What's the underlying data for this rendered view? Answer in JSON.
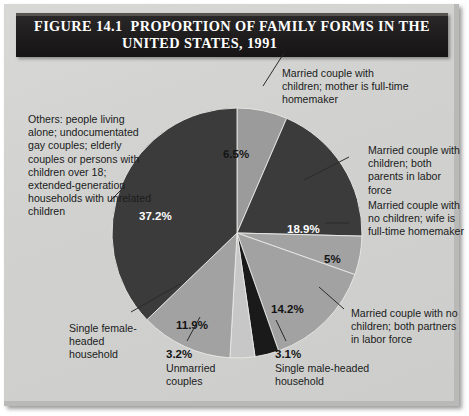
{
  "figure": {
    "number": "FIGURE 14.1",
    "title_line1": "PROPORTION OF FAMILY FORMS IN THE",
    "title_line2": "UNITED STATES, 1991"
  },
  "colors": {
    "background": "#d3d4d2",
    "title_bar": "#211f20",
    "title_text": "#ffffff",
    "label_text": "#1b1b1b",
    "slice_light_gray": "#9b9b9b",
    "slice_dark": "#3b3b3b",
    "slice_mid_gray": "#a2a2a2",
    "slice_pale_gray": "#c7c7c7",
    "slice_black": "#1a1a1a"
  },
  "labels": {
    "others": "Others: people living alone; undocumentated gay couples; elderly couples or persons with children over 18; extended-generation households with unrelated children",
    "married_children_homemaker": "Married couple with children; mother is full-time homemaker",
    "married_children_both_labor": "Married couple with children; both parents in labor force",
    "married_nochildren_wife_homemaker": "Married couple with no children; wife is full-time homemaker",
    "married_nochildren_both_labor": "Married couple with no children; both partners in labor force",
    "single_female_household": "Single female-headed household",
    "unmarried_couples": "Unmarried couples",
    "single_male_household": "Single male-headed household"
  },
  "chart_data": {
    "type": "pie",
    "unit": "percent",
    "legend": "callout labels with leader lines",
    "start_angle_deg": 0,
    "direction": "clockwise",
    "categories": [
      "Married couple with children; mother is full-time homemaker",
      "Married couple with children; both parents in labor force",
      "Married couple with no children; wife is full-time homemaker",
      "Married couple with no children; both partners in labor force",
      "Single male-headed household",
      "Unmarried couples",
      "Single female-headed household",
      "Others: people living alone; undocumentated gay couples; elderly couples or persons with children over 18; extended-generation households with unrelated children"
    ],
    "values": [
      6.5,
      18.9,
      5,
      14.2,
      3.1,
      3.2,
      11.9,
      37.2
    ],
    "value_labels": [
      "6.5%",
      "18.9%",
      "5%",
      "14.2%",
      "3.1%",
      "3.2%",
      "11.9%",
      "37.2%"
    ],
    "colors": [
      "#9b9b9b",
      "#3b3b3b",
      "#a2a2a2",
      "#a2a2a2",
      "#1a1a1a",
      "#c7c7c7",
      "#a2a2a2",
      "#3b3b3b"
    ]
  }
}
